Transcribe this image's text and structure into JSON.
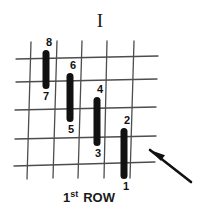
{
  "figure": {
    "title": "I",
    "caption": {
      "number": "1",
      "ordinal_suffix": "st",
      "word": "ROW"
    },
    "colors": {
      "bar": "#111111",
      "grid": "#4d4d4d",
      "arrow": "#111111",
      "text": "#1a1a1a",
      "background": "#ffffff"
    },
    "grid": {
      "vertical_lines": [
        {
          "x_top": 31,
          "y_top": 42,
          "x_bottom": 27,
          "y_bottom": 179
        },
        {
          "x_top": 57,
          "y_top": 41,
          "x_bottom": 53,
          "y_bottom": 178
        },
        {
          "x_top": 82,
          "y_top": 41,
          "x_bottom": 78,
          "y_bottom": 178
        },
        {
          "x_top": 107,
          "y_top": 41,
          "x_bottom": 104,
          "y_bottom": 178
        },
        {
          "x_top": 134,
          "y_top": 41,
          "x_bottom": 130,
          "y_bottom": 178
        }
      ],
      "horizontal_lines": [
        {
          "x_left": 16,
          "y_left": 59,
          "x_right": 158,
          "y_right": 56
        },
        {
          "x_left": 16,
          "y_left": 82,
          "x_right": 157,
          "y_right": 79
        },
        {
          "x_left": 15,
          "y_left": 110,
          "x_right": 156,
          "y_right": 107
        },
        {
          "x_left": 15,
          "y_left": 139,
          "x_right": 156,
          "y_right": 136
        },
        {
          "x_left": 14,
          "y_left": 166,
          "x_right": 155,
          "y_right": 162
        }
      ]
    },
    "bars": [
      {
        "id": "bar-8-7",
        "x": 46,
        "y_top": 50,
        "y_bottom": 89,
        "width": 7,
        "top_label": "8",
        "bottom_label": "7",
        "top_label_x": 42,
        "top_label_y": 37,
        "bottom_label_x": 39,
        "bottom_label_y": 91
      },
      {
        "id": "bar-6-5",
        "x": 70,
        "y_top": 73,
        "y_bottom": 122,
        "width": 7,
        "top_label": "6",
        "bottom_label": "5",
        "top_label_x": 66,
        "top_label_y": 60,
        "bottom_label_x": 64,
        "bottom_label_y": 124
      },
      {
        "id": "bar-4-3",
        "x": 97,
        "y_top": 97,
        "y_bottom": 146,
        "width": 7,
        "top_label": "4",
        "bottom_label": "3",
        "top_label_x": 93,
        "top_label_y": 84,
        "bottom_label_x": 91,
        "bottom_label_y": 148
      },
      {
        "id": "bar-2-1",
        "x": 124,
        "y_top": 128,
        "y_bottom": 179,
        "width": 7,
        "top_label": "2",
        "bottom_label": "1",
        "top_label_x": 120,
        "top_label_y": 115,
        "bottom_label_x": 119,
        "bottom_label_y": 181
      }
    ],
    "arrow": {
      "tail_x": 191,
      "tail_y": 182,
      "tip_x": 150,
      "tip_y": 150,
      "label": "pointer-arrow"
    }
  }
}
